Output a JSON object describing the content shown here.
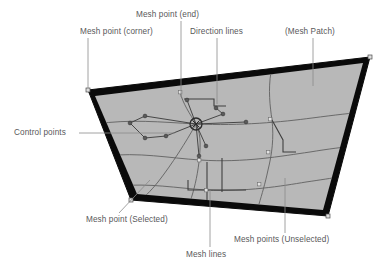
{
  "figure": {
    "background_color": "#ffffff"
  },
  "colors": {
    "patch_fill": "#b8b8b8",
    "patch_border": "#0a0a0a",
    "mesh_line": "#5d5d5d",
    "direction_line": "#3a3a3a",
    "label_text": "#58585a",
    "leader_line": "#8a8a8a",
    "point_marker": "#d9d9d9",
    "selected_point_stroke": "#2b2b2b"
  },
  "labels": {
    "mesh_point_end": "Mesh point (end)",
    "mesh_point_corner": "Mesh point (corner)",
    "direction_lines": "Direction lines",
    "mesh_patch": "(Mesh Patch)",
    "control_points": "Control points",
    "mesh_point_selected": "Mesh point (Selected)",
    "mesh_lines": "Mesh lines",
    "mesh_points_unselected": "Mesh points (Unselected)"
  },
  "patch": {
    "corners": [
      {
        "name": "top-left",
        "x": 88,
        "y": 90
      },
      {
        "name": "top-right",
        "x": 370,
        "y": 57
      },
      {
        "name": "bottom-right",
        "x": 328,
        "y": 216
      },
      {
        "name": "bottom-left",
        "x": 131,
        "y": 200
      }
    ],
    "border_width": 7
  },
  "selected_point": {
    "x": 196,
    "y": 124,
    "radius": 6
  },
  "leaders": [
    {
      "name": "leader-mesh-point-corner",
      "x1": 88,
      "y1": 38,
      "x2": 88,
      "y2": 90
    },
    {
      "name": "leader-mesh-point-end",
      "x1": 181,
      "y1": 21,
      "x2": 181,
      "y2": 97
    },
    {
      "name": "leader-direction-lines",
      "x1": 217,
      "y1": 38,
      "x2": 217,
      "y2": 104
    },
    {
      "name": "leader-mesh-patch",
      "x1": 313,
      "y1": 38,
      "x2": 313,
      "y2": 86
    },
    {
      "name": "leader-control-points",
      "x1": 79,
      "y1": 133,
      "x2": 175,
      "y2": 133
    },
    {
      "name": "leader-mesh-point-selected",
      "x1": 119,
      "y1": 213,
      "x2": 148,
      "y2": 182
    },
    {
      "name": "leader-mesh-lines",
      "x1": 210,
      "y1": 247,
      "x2": 210,
      "y2": 190
    },
    {
      "name": "leader-mesh-points-unsel",
      "x1": 285,
      "y1": 233,
      "x2": 285,
      "y2": 178
    }
  ]
}
